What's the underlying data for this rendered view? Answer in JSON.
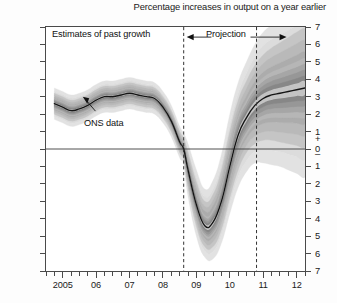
{
  "title": "Percentage increases in output on a year earlier",
  "annotations": {
    "past_growth": "Estimates of past growth",
    "projection": "Projection",
    "ons_data": "ONS data"
  },
  "axes": {
    "y_label_top_sign": "+",
    "y_label_bottom_sign": "–",
    "y_ticks": [
      7,
      6,
      5,
      4,
      3,
      2,
      1,
      0,
      1,
      2,
      3,
      4,
      5,
      6,
      7
    ],
    "y_tick_labels": [
      "7",
      "6",
      "5",
      "4",
      "3",
      "2",
      "1",
      "0",
      "1",
      "2",
      "3",
      "4",
      "5",
      "6",
      "7"
    ],
    "x_tick_labels": [
      "2005",
      "06",
      "07",
      "08",
      "09",
      "10",
      "11",
      "12"
    ],
    "ylim": [
      -7,
      7
    ],
    "xlim": [
      2004.5,
      2012.25
    ],
    "grid": false
  },
  "colors": {
    "frame": "#4a4a4a",
    "zero_line": "#3c3c3c",
    "dashed_divider": "#333333",
    "central_line": "#151515",
    "band_darkest": "#6f6f6f",
    "band_lightest": "#e8e8e8",
    "text": "#1a1a1a"
  },
  "chart_data": {
    "type": "area",
    "title": "Percentage increases in output on a year earlier",
    "subtitle": "",
    "xlabel": "",
    "ylabel": "Percentage increases in output on a year earlier",
    "xlim": [
      2004.5,
      2012.25
    ],
    "ylim": [
      -7,
      7
    ],
    "grid": false,
    "legend_position": "none",
    "annotations": [
      {
        "text": "Estimates of past growth",
        "x": 2006.0,
        "y": 6.4
      },
      {
        "text": "Projection",
        "x": 2010.1,
        "y": 6.4
      },
      {
        "text": "ONS data",
        "x": 2006.1,
        "y": 2.0,
        "points_to": {
          "x": 2005.6,
          "y": 3.0
        }
      }
    ],
    "vertical_markers": [
      {
        "x": 2008.62,
        "style": "dashed",
        "label": "projection-start"
      },
      {
        "x": 2010.8,
        "style": "dashed",
        "label": "forecast-horizon"
      }
    ],
    "horizontal_markers": [
      {
        "y": 0,
        "style": "solid"
      }
    ],
    "x": [
      2004.75,
      2005.0,
      2005.25,
      2005.5,
      2005.75,
      2006.0,
      2006.25,
      2006.5,
      2006.75,
      2007.0,
      2007.25,
      2007.5,
      2007.75,
      2008.0,
      2008.25,
      2008.5,
      2008.62,
      2008.75,
      2009.0,
      2009.25,
      2009.5,
      2009.75,
      2010.0,
      2010.25,
      2010.5,
      2010.75,
      2011.0,
      2011.25,
      2011.5,
      2011.75,
      2012.0,
      2012.25
    ],
    "series": [
      {
        "name": "Central projection (mode)",
        "kind": "line",
        "values": [
          2.6,
          2.4,
          2.2,
          2.3,
          2.5,
          2.8,
          3.0,
          3.0,
          3.1,
          3.2,
          3.1,
          3.0,
          2.9,
          2.4,
          1.6,
          0.4,
          0.0,
          -1.2,
          -3.2,
          -4.4,
          -4.2,
          -3.0,
          -1.0,
          0.8,
          1.8,
          2.5,
          2.9,
          3.1,
          3.2,
          3.3,
          3.4,
          3.5
        ]
      },
      {
        "name": "30% probability band",
        "kind": "band",
        "shade": "#6f6f6f",
        "lower": [
          2.3,
          2.1,
          1.9,
          2.0,
          2.2,
          2.5,
          2.7,
          2.7,
          2.8,
          2.9,
          2.8,
          2.7,
          2.6,
          2.1,
          1.3,
          0.1,
          -0.3,
          -1.7,
          -3.8,
          -5.0,
          -4.9,
          -3.8,
          -1.9,
          -0.2,
          0.8,
          1.4,
          1.7,
          1.8,
          1.8,
          1.8,
          1.8,
          1.8
        ],
        "upper": [
          2.9,
          2.7,
          2.5,
          2.6,
          2.8,
          3.1,
          3.3,
          3.3,
          3.4,
          3.5,
          3.4,
          3.3,
          3.2,
          2.7,
          1.9,
          0.7,
          0.3,
          -0.7,
          -2.6,
          -3.8,
          -3.5,
          -2.2,
          -0.1,
          1.8,
          2.8,
          3.6,
          4.1,
          4.4,
          4.6,
          4.8,
          5.0,
          5.2
        ]
      },
      {
        "name": "60% probability band",
        "kind": "band",
        "shade": "#8d8d8d",
        "lower": [
          2.0,
          1.8,
          1.6,
          1.7,
          1.9,
          2.2,
          2.4,
          2.4,
          2.5,
          2.6,
          2.5,
          2.4,
          2.3,
          1.8,
          1.0,
          -0.2,
          -0.6,
          -2.2,
          -4.4,
          -5.6,
          -5.6,
          -4.6,
          -2.8,
          -1.2,
          -0.2,
          0.3,
          0.5,
          0.5,
          0.4,
          0.3,
          0.2,
          0.1
        ],
        "upper": [
          3.2,
          3.0,
          2.8,
          2.9,
          3.1,
          3.4,
          3.6,
          3.6,
          3.7,
          3.8,
          3.7,
          3.6,
          3.5,
          3.0,
          2.2,
          1.0,
          0.6,
          -0.2,
          -1.9,
          -3.0,
          -2.6,
          -1.2,
          1.0,
          2.8,
          3.9,
          4.8,
          5.4,
          5.8,
          6.1,
          6.4,
          6.7,
          6.9
        ]
      },
      {
        "name": "90% probability band",
        "kind": "band",
        "shade": "#c6c6c6",
        "lower": [
          1.7,
          1.5,
          1.3,
          1.4,
          1.6,
          1.9,
          2.1,
          2.1,
          2.2,
          2.3,
          2.2,
          2.1,
          2.0,
          1.5,
          0.7,
          -0.5,
          -0.9,
          -2.7,
          -5.0,
          -6.2,
          -6.3,
          -5.4,
          -3.7,
          -2.2,
          -1.3,
          -0.8,
          -0.8,
          -0.9,
          -1.0,
          -1.2,
          -1.4,
          -1.6
        ],
        "upper": [
          3.5,
          3.3,
          3.1,
          3.2,
          3.4,
          3.7,
          3.9,
          3.9,
          4.0,
          4.1,
          4.0,
          3.9,
          3.8,
          3.3,
          2.5,
          1.3,
          0.9,
          0.3,
          -1.2,
          -2.3,
          -1.8,
          -0.3,
          2.0,
          3.8,
          5.0,
          6.0,
          6.7,
          7.1,
          7.4,
          7.7,
          8.0,
          8.2
        ]
      }
    ]
  }
}
